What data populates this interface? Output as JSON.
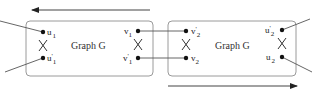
{
  "diagram": {
    "colors": {
      "stroke": "#444444",
      "box": "#9a9a9a",
      "node": "#111111",
      "text": "#222222"
    },
    "arrows": [
      {
        "id": "top-arrow",
        "direction": "left",
        "x1": 150,
        "y1": 10,
        "x2": 31,
        "y2": 10
      },
      {
        "id": "bottom-arrow",
        "direction": "right",
        "x1": 168,
        "y1": 86,
        "x2": 298,
        "y2": 86
      }
    ],
    "boxes": [
      {
        "id": "left-graph",
        "label": "Graph G",
        "x": 26,
        "y": 21,
        "w": 127,
        "h": 55
      },
      {
        "id": "right-graph",
        "label": "Graph G",
        "x": 168,
        "y": 21,
        "w": 128,
        "h": 55
      }
    ],
    "nodes": {
      "u1": {
        "base": "u",
        "sup": "",
        "sub": "1",
        "x": 43,
        "y": 32
      },
      "u1p": {
        "base": "u",
        "sup": "'",
        "sub": "1",
        "x": 43,
        "y": 58
      },
      "v1": {
        "base": "v",
        "sup": "",
        "sub": "1",
        "x": 138,
        "y": 31
      },
      "v1p": {
        "base": "v",
        "sup": "'",
        "sub": "1",
        "x": 138,
        "y": 58
      },
      "v2p": {
        "base": "v",
        "sup": "'",
        "sub": "2",
        "x": 186,
        "y": 31
      },
      "v2": {
        "base": "v",
        "sup": "",
        "sub": "2",
        "x": 186,
        "y": 58
      },
      "u2p": {
        "base": "u",
        "sup": "'",
        "sub": "2",
        "x": 282,
        "y": 30
      },
      "u2": {
        "base": "u",
        "sup": "",
        "sub": "2",
        "x": 282,
        "y": 57
      }
    },
    "labels": {
      "u1": "u",
      "u1_sub": "1",
      "u1p": "u",
      "u1p_sup": "'",
      "u1p_sub": "1",
      "v1": "v",
      "v1_sub": "1",
      "v1p": "v",
      "v1p_sup": "'",
      "v1p_sub": "1",
      "v2p": "v",
      "v2p_sup": "'",
      "v2p_sub": "2",
      "v2": "v",
      "v2_sub": "2",
      "u2p": "u",
      "u2p_sup": "'",
      "u2p_sub": "2",
      "u2": "u",
      "u2_sub": "2",
      "left_title": "Graph G",
      "right_title": "Graph G"
    },
    "connections": [
      {
        "from": "v1",
        "to": "v2p"
      },
      {
        "from": "v1p",
        "to": "v2"
      }
    ],
    "crossings": [
      "u-pair-left",
      "v-pair-left",
      "v-pair-right",
      "u-pair-right"
    ],
    "external_edges": [
      {
        "node": "u1",
        "to_x": 0,
        "to_y": 21
      },
      {
        "node": "u1p",
        "to_x": 5,
        "to_y": 72
      },
      {
        "node": "u2p",
        "to_x": 310,
        "to_y": 19
      },
      {
        "node": "u2",
        "to_x": 312,
        "to_y": 72
      }
    ]
  }
}
